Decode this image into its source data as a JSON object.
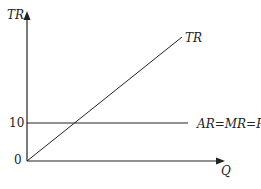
{
  "diagram": {
    "y_axis_label": "TR",
    "x_axis_label": "Q",
    "tick_labels": {
      "origin": "0",
      "price": "10"
    },
    "curves": [
      {
        "id": "tr",
        "label": "TR",
        "type": "line-through-origin"
      },
      {
        "id": "demand",
        "label": "AR=MR=P",
        "type": "horizontal",
        "value": 10
      }
    ],
    "colors": {
      "line": "#222222",
      "background": "#ffffff"
    }
  }
}
